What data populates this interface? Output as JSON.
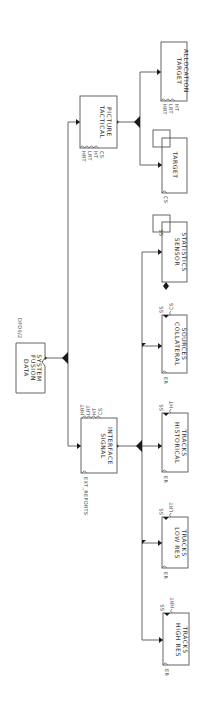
{
  "diagram": {
    "title": "DFD0/2",
    "orientation": "rotated 90 degrees clockwise",
    "root": {
      "name": "DATA FUSION SYSTEM",
      "lines": [
        "DATA",
        "FUSION",
        "SYSTEM"
      ]
    },
    "nodes": {
      "tactical_picture": {
        "lines": [
          "TACTICAL",
          "PICTURE"
        ],
        "ports": [
          "HRT",
          "LRT",
          "HT",
          "CS"
        ]
      },
      "target_allocation": {
        "lines": [
          "TARGET",
          "ALLOCATION"
        ],
        "ports": [
          "HRT",
          "LRT",
          "HT"
        ]
      },
      "target": {
        "lines": [
          "TARGET"
        ],
        "ports": [
          "CS"
        ]
      },
      "signal_interface": {
        "lines": [
          "SIGNAL",
          "INTERFACE"
        ],
        "ports": [
          "HRT",
          "LRT",
          "HT",
          "CS"
        ],
        "input_port": "EXT_REPORTS"
      },
      "sensor_statistics": {
        "lines": [
          "SENSOR",
          "STATISTICS"
        ],
        "ports": [
          "SS"
        ]
      },
      "collateral_sources": {
        "lines": [
          "COLLATERAL",
          "SOURCES"
        ],
        "ports": [
          "SS",
          "CS"
        ],
        "input_port": "ER"
      },
      "historical_tracks": {
        "lines": [
          "HISTORICAL",
          "TRACKS"
        ],
        "ports": [
          "SS",
          "HT"
        ],
        "input_port": "ER"
      },
      "low_res_tracks": {
        "lines": [
          "LOW RES",
          "TRACKS"
        ],
        "ports": [
          "SS",
          "LRT"
        ],
        "input_port": "ER"
      },
      "high_res_tracks": {
        "lines": [
          "HIGH RES",
          "TRACKS"
        ],
        "ports": [
          "SS",
          "HRT"
        ],
        "input_port": "ER"
      }
    }
  }
}
